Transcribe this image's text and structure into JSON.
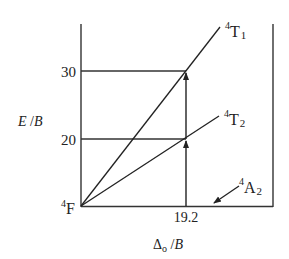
{
  "diagram": {
    "y_axis": {
      "label_main": "E",
      "label_sep": " /",
      "label_unit": "B",
      "ticks": [
        "30",
        "20"
      ],
      "range": [
        0,
        37
      ]
    },
    "x_axis": {
      "label_delta": "Δ",
      "label_sub": "o",
      "label_sep": " /",
      "label_unit": "B",
      "tick": "19.2",
      "range": [
        0,
        30
      ]
    },
    "ground_state": {
      "sup": "4",
      "term": "F"
    },
    "levels": [
      {
        "sup": "4",
        "term": "T",
        "sub": "1",
        "value_at_tick": 30
      },
      {
        "sup": "4",
        "term": "T",
        "sub": "2",
        "value_at_tick": 20
      },
      {
        "sup": "4",
        "term": "A",
        "sub": "2",
        "value_at_tick": 0
      }
    ],
    "transitions": [
      {
        "from": "4A2",
        "to": "4T2",
        "energy": 20
      },
      {
        "from": "4A2",
        "to": "4T1",
        "energy": 30
      }
    ]
  }
}
